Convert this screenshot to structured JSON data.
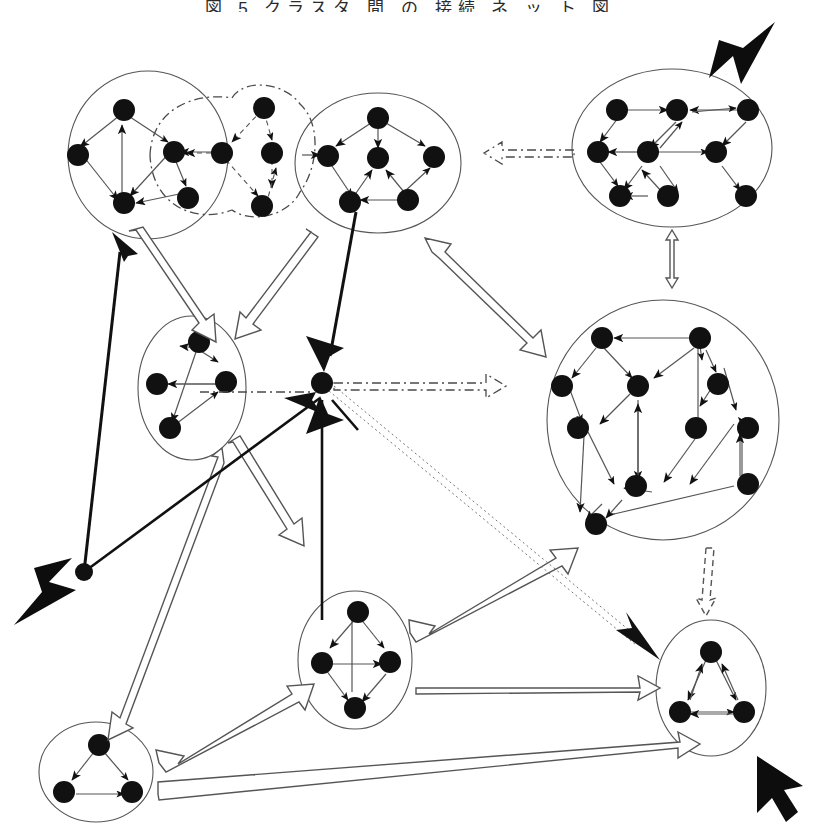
{
  "figure": {
    "title_clipped": "図 5 クラスタ 間 の 接続 ネ ッ ト 図",
    "background_color": "#ffffff",
    "ink_color": "#000000",
    "cluster_outline_color": "#555555",
    "edge_color": "#555555",
    "node_fill": "#111111",
    "hollow_arrow_fill": "#ffffff",
    "hollow_arrow_stroke": "#555555",
    "dashdot_stroke": "#4a4a4a",
    "cursor_arrow_fill": "#0d0d0d"
  },
  "clusters": [
    {
      "id": "c1",
      "name": "cluster-top-left",
      "shape": "ellipse",
      "cx": 148,
      "cy": 155,
      "rx": 80,
      "ry": 84,
      "node_count": 5
    },
    {
      "id": "c2",
      "name": "cluster-top-middle",
      "shape": "ellipse",
      "cx": 378,
      "cy": 163,
      "rx": 83,
      "ry": 70,
      "node_count": 6
    },
    {
      "id": "c3",
      "name": "cluster-top-right",
      "shape": "ellipse",
      "cx": 672,
      "cy": 148,
      "rx": 100,
      "ry": 79,
      "node_count": 8
    },
    {
      "id": "c4",
      "name": "cluster-left-middle",
      "shape": "ellipse",
      "cx": 192,
      "cy": 388,
      "rx": 54,
      "ry": 72,
      "node_count": 4
    },
    {
      "id": "c5",
      "name": "cluster-right-large",
      "shape": "ellipse",
      "cx": 663,
      "cy": 420,
      "rx": 116,
      "ry": 120,
      "node_count": 10
    },
    {
      "id": "c6",
      "name": "cluster-bottom-middle",
      "shape": "ellipse",
      "cx": 355,
      "cy": 660,
      "rx": 57,
      "ry": 69,
      "node_count": 4
    },
    {
      "id": "c7",
      "name": "cluster-bottom-right",
      "shape": "ellipse",
      "cx": 711,
      "cy": 688,
      "rx": 55,
      "ry": 68,
      "node_count": 3
    },
    {
      "id": "c8",
      "name": "cluster-bottom-left",
      "shape": "ellipse",
      "cx": 96,
      "cy": 772,
      "rx": 57,
      "ry": 50,
      "node_count": 3
    },
    {
      "id": "overlay",
      "name": "dashdot-overlay-region",
      "shape": "dash-dot-blob",
      "node_count": 0
    }
  ],
  "hub": {
    "name": "central-hub-node",
    "x": 322,
    "y": 383,
    "incoming": 4,
    "outgoing": 3
  },
  "lone_node": {
    "name": "isolated-node-left",
    "x": 84,
    "y": 572
  },
  "cursor_arrows": [
    {
      "name": "cursor-arrow-top-right",
      "x": 748,
      "y": 46,
      "angle": 225
    },
    {
      "name": "cursor-arrow-bottom-left",
      "x": 44,
      "y": 600,
      "angle": 315
    },
    {
      "name": "cursor-arrow-bottom-right",
      "x": 779,
      "y": 786,
      "angle": 315
    },
    {
      "name": "cursor-arrowhead-hub",
      "x": 324,
      "y": 368,
      "angle": 160
    }
  ],
  "connectors": {
    "hollow_block_arrows": 11,
    "dash_dot_arrows": 3,
    "dotted_arrows": 1,
    "solid_black_lines": 3
  }
}
